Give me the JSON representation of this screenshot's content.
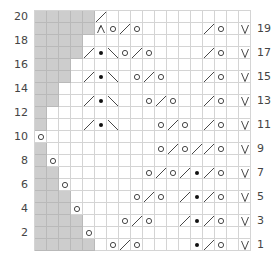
{
  "chart_data": {
    "type": "table",
    "columns": 18,
    "rows": 20,
    "row_labels_left": [
      "2",
      "4",
      "6",
      "8",
      "10",
      "12",
      "14",
      "16",
      "18",
      "20"
    ],
    "row_labels_right": [
      "1",
      "3",
      "5",
      "7",
      "9",
      "11",
      "13",
      "15",
      "17",
      "19"
    ],
    "legend": {
      "G": "no stitch (gray)",
      "O": "yarn over",
      "/": "k2tog (right-slanting decrease)",
      "\\": "ssk (left-slanting decrease)",
      "B": "bobble / dot",
      "V": "slip stitch",
      "A": "central double decrease",
      ".": "knit (empty)"
    },
    "grid_rows_top_to_bottom": [
      {
        "row": 20,
        "cells": "GGGGG/............"
      },
      {
        "row": 19,
        "cells": "GGGGGAO/O...../O.V"
      },
      {
        "row": 18,
        "cells": "GGGG.............."
      },
      {
        "row": 17,
        "cells": "GGGG/B\\O/O..../O.V"
      },
      {
        "row": 16,
        "cells": "GGG..............."
      },
      {
        "row": 15,
        "cells": "GGG./B\\.O/O.../O.V"
      },
      {
        "row": 14,
        "cells": "GG................"
      },
      {
        "row": 13,
        "cells": "GG../B\\..O/O../O.V"
      },
      {
        "row": 12,
        "cells": "G................."
      },
      {
        "row": 11,
        "cells": "G.../B\\...O/O./O.V"
      },
      {
        "row": 10,
        "cells": "O................."
      },
      {
        "row": 9,
        "cells": "G.........O/O//O.V"
      },
      {
        "row": 8,
        "cells": "GO................"
      },
      {
        "row": 7,
        "cells": "GG.......O/O/B/O.V"
      },
      {
        "row": 6,
        "cells": "GGO..............."
      },
      {
        "row": 5,
        "cells": "GGG.....O/O./B/O.V"
      },
      {
        "row": 4,
        "cells": "GGGO.............."
      },
      {
        "row": 3,
        "cells": "GGGG...O/O../B/O.V"
      },
      {
        "row": 2,
        "cells": "GGGGO............."
      },
      {
        "row": 1,
        "cells": "GGGGG.O/O....B/O.V"
      }
    ]
  },
  "colors": {
    "gray": "#cdcdcd",
    "grid": "#d4d4d4",
    "ink": "#333333"
  }
}
